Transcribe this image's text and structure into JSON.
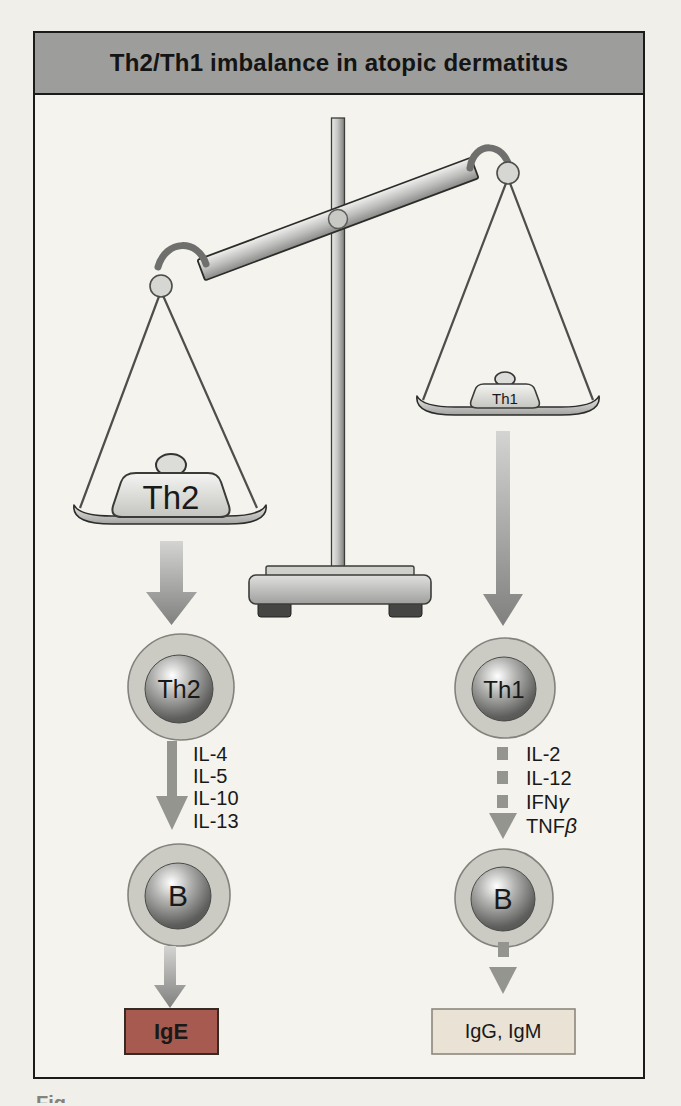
{
  "figure": {
    "title": "Th2/Th1 imbalance in atopic dermatitus",
    "caption_fragment": "Fig.",
    "scale": {
      "left_weight": "Th2",
      "right_weight": "Th1"
    },
    "left_pathway": {
      "cell": "Th2",
      "cytokines": [
        {
          "t": "IL-4"
        },
        {
          "t": "IL-5"
        },
        {
          "t": "IL-10"
        },
        {
          "t": "IL-13"
        }
      ],
      "b_cell": "B",
      "product": "IgE"
    },
    "right_pathway": {
      "cell": "Th1",
      "cytokines": [
        {
          "t": "IL-2"
        },
        {
          "t": "IL-12"
        },
        {
          "t": "IFN",
          "g": "γ"
        },
        {
          "t": "TNF",
          "g": "β"
        }
      ],
      "b_cell": "B",
      "product": "IgG, IgM"
    },
    "colors": {
      "title_bar": "#9d9d9b",
      "figure_bg": "#f5f3ed",
      "ige_box": "#a65a50",
      "igg_igm_box": "#eae2d4"
    }
  }
}
